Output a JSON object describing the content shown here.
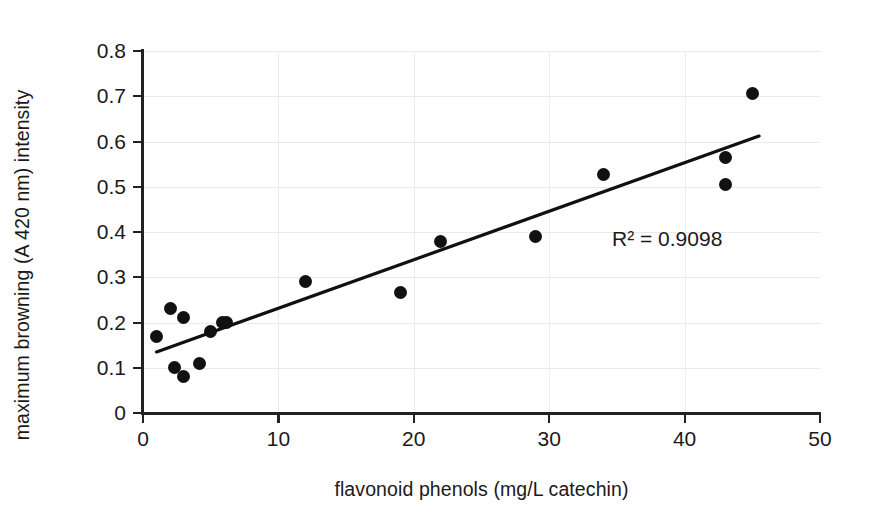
{
  "chart_data": {
    "type": "scatter",
    "title": "",
    "xlabel": "flavonoid phenols (mg/L catechin)",
    "ylabel": "maximum browning (A 420 nm) intensity",
    "xlim": [
      0,
      50
    ],
    "ylim": [
      0,
      0.8
    ],
    "xticks": [
      "0",
      "10",
      "20",
      "30",
      "40",
      "50"
    ],
    "xtick_values": [
      0,
      10,
      20,
      30,
      40,
      50
    ],
    "yticks": [
      "0",
      "0.1",
      "0.2",
      "0.3",
      "0.4",
      "0.5",
      "0.6",
      "0.7",
      "0.8"
    ],
    "ytick_values": [
      0,
      0.1,
      0.2,
      0.3,
      0.4,
      0.5,
      0.6,
      0.7,
      0.8
    ],
    "grid": true,
    "legend": false,
    "marker_color": "#111111",
    "trendline_color": "#111111",
    "annotation": "R² = 0.9098",
    "points": [
      {
        "x": 1.0,
        "y": 0.17
      },
      {
        "x": 2.0,
        "y": 0.23
      },
      {
        "x": 2.3,
        "y": 0.1
      },
      {
        "x": 3.0,
        "y": 0.21
      },
      {
        "x": 3.0,
        "y": 0.08
      },
      {
        "x": 4.2,
        "y": 0.11
      },
      {
        "x": 5.0,
        "y": 0.18
      },
      {
        "x": 5.9,
        "y": 0.2
      },
      {
        "x": 6.2,
        "y": 0.2
      },
      {
        "x": 12.0,
        "y": 0.29
      },
      {
        "x": 19.0,
        "y": 0.267
      },
      {
        "x": 22.0,
        "y": 0.378
      },
      {
        "x": 29.0,
        "y": 0.391
      },
      {
        "x": 34.0,
        "y": 0.527
      },
      {
        "x": 43.0,
        "y": 0.505
      },
      {
        "x": 43.0,
        "y": 0.565
      },
      {
        "x": 45.0,
        "y": 0.705
      }
    ],
    "trendline": {
      "x1": 1.0,
      "y1": 0.135,
      "x2": 45.5,
      "y2": 0.612
    }
  }
}
